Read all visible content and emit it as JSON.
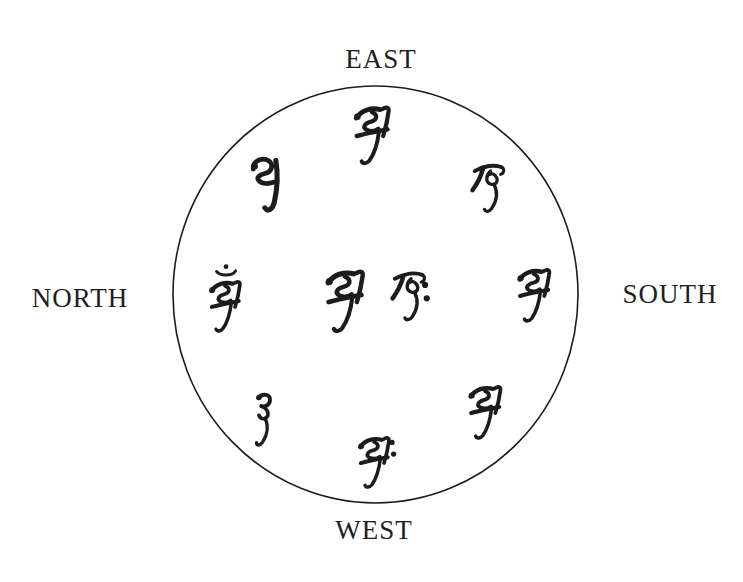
{
  "colors": {
    "ink": "#1c1c1c",
    "background": "#ffffff"
  },
  "diagram": {
    "kind": "circle of Siddham seed syllables arranged by compass direction (east at top)",
    "directions": {
      "top": "EAST",
      "left": "NORTH",
      "right": "SOUTH",
      "bottom": "WEST"
    },
    "syllables": [
      {
        "position": "top (east)",
        "glyph": "Siddham syllable a"
      },
      {
        "position": "upper-left (between north and east)",
        "glyph": "Siddham syllable with curled head and long vertical stroke"
      },
      {
        "position": "upper-right (between east and south)",
        "glyph": "Siddham syllable ka"
      },
      {
        "position": "left (north)",
        "glyph": "Siddham syllable a with crescent and dot (anusvara) above"
      },
      {
        "position": "center-left",
        "glyph": "Siddham syllable a"
      },
      {
        "position": "center-right",
        "glyph": "Siddham syllable ka with two dots (visarga) at right"
      },
      {
        "position": "right (south)",
        "glyph": "Siddham syllable a"
      },
      {
        "position": "lower-left (between north and west)",
        "glyph": "Siddham syllable with hooked head and descender"
      },
      {
        "position": "lower-right (between south and west)",
        "glyph": "Siddham syllable a"
      },
      {
        "position": "bottom (west)",
        "glyph": "Siddham syllable a with two dots (visarga) at right"
      }
    ]
  }
}
